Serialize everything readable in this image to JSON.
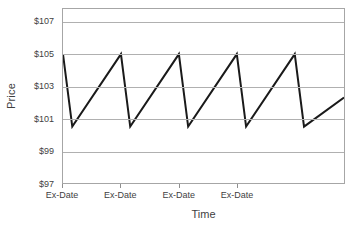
{
  "chart_data": {
    "type": "line",
    "title": "",
    "xlabel": "Time",
    "ylabel": "Price",
    "ylim": [
      97,
      107.8
    ],
    "yticks": [
      97,
      99,
      101,
      103,
      105,
      107
    ],
    "ytick_labels": [
      "$97",
      "$99",
      "$101",
      "$103",
      "$105",
      "$107"
    ],
    "xlim": [
      0,
      4.85
    ],
    "xticks": [
      0,
      1,
      2,
      3
    ],
    "xtick_labels": [
      "Ex-Date",
      "Ex-Date",
      "Ex-Date",
      "Ex-Date"
    ],
    "grid": true,
    "legend": false,
    "legend_position": "none",
    "series": [
      {
        "name": "Price",
        "color": "#1a1a1a",
        "line_width": 2,
        "x": [
          0,
          0.16,
          1,
          1.16,
          2,
          2.16,
          3,
          3.16,
          4,
          4.16,
          4.85
        ],
        "y": [
          105.0,
          100.5,
          105.0,
          100.5,
          105.0,
          100.5,
          105.0,
          100.5,
          105.0,
          100.5,
          102.3
        ]
      }
    ],
    "annotations": [
      "Price drops by the dividend amount on each Ex-Date, then drifts back up."
    ]
  }
}
